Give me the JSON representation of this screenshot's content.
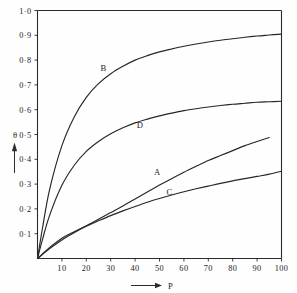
{
  "chart_data": {
    "type": "line",
    "title": "",
    "xlabel": "P",
    "ylabel": "θ",
    "xlim": [
      0,
      100
    ],
    "ylim": [
      0,
      1.0
    ],
    "grid": false,
    "legend": "inline-curve-labels",
    "x_ticks": [
      10,
      20,
      30,
      40,
      50,
      60,
      70,
      80,
      90,
      100
    ],
    "x_tick_labels": [
      "10",
      "20",
      "30",
      "40",
      "50",
      "60",
      "70",
      "80",
      "90",
      "100"
    ],
    "y_ticks": [
      0.1,
      0.2,
      0.3,
      0.4,
      0.5,
      0.6,
      0.7,
      0.8,
      0.9,
      1.0
    ],
    "y_tick_labels": [
      "0·1",
      "0·2",
      "0·3",
      "0·4",
      "0·5",
      "0·6",
      "0·7",
      "0·8",
      "0·9",
      "1·0"
    ],
    "x": [
      0,
      2,
      5,
      10,
      15,
      20,
      25,
      30,
      35,
      40,
      45,
      50,
      55,
      60,
      65,
      70,
      75,
      80,
      85,
      90,
      95,
      100
    ],
    "series": [
      {
        "name": "A",
        "label": "A",
        "label_x": 49,
        "label_y": 0.335,
        "x_end": 95,
        "values": [
          0,
          0.018,
          0.045,
          0.082,
          0.108,
          0.132,
          0.158,
          0.185,
          0.212,
          0.24,
          0.268,
          0.296,
          0.322,
          0.348,
          0.372,
          0.395,
          0.415,
          0.435,
          0.455,
          0.472,
          0.488,
          null
        ]
      },
      {
        "name": "B",
        "label": "B",
        "label_x": 27,
        "label_y": 0.755,
        "x_end": 100,
        "values": [
          0,
          0.12,
          0.28,
          0.455,
          0.57,
          0.65,
          0.705,
          0.745,
          0.775,
          0.8,
          0.818,
          0.833,
          0.845,
          0.856,
          0.865,
          0.873,
          0.88,
          0.886,
          0.892,
          0.897,
          0.901,
          0.905
        ]
      },
      {
        "name": "C",
        "label": "C",
        "label_x": 54,
        "label_y": 0.255,
        "x_end": 100,
        "values": [
          0,
          0.016,
          0.04,
          0.075,
          0.104,
          0.13,
          0.152,
          0.173,
          0.192,
          0.21,
          0.227,
          0.242,
          0.256,
          0.269,
          0.281,
          0.292,
          0.303,
          0.313,
          0.322,
          0.331,
          0.34,
          0.352
        ]
      },
      {
        "name": "D",
        "label": "D",
        "label_x": 42,
        "label_y": 0.525,
        "x_end": 100,
        "values": [
          0,
          0.075,
          0.175,
          0.295,
          0.375,
          0.432,
          0.472,
          0.503,
          0.527,
          0.547,
          0.562,
          0.575,
          0.586,
          0.596,
          0.604,
          0.611,
          0.617,
          0.622,
          0.626,
          0.63,
          0.632,
          0.634
        ]
      }
    ]
  },
  "axes": {
    "y_axis_symbol": "θ",
    "x_axis_symbol": "P"
  }
}
